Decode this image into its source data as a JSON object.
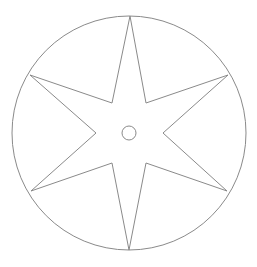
{
  "diagram": {
    "type": "six-pointed-star-in-circle",
    "stroke_color": "#8a8a8a",
    "outer_circle": {
      "cx": 129,
      "cy": 133,
      "r": 117
    },
    "inner_circle": {
      "cx": 129,
      "cy": 133,
      "r": 7
    },
    "star_points": [
      [
        130,
        16
      ],
      [
        146,
        103
      ],
      [
        228,
        75
      ],
      [
        163,
        133
      ],
      [
        227,
        191
      ],
      [
        146,
        163
      ],
      [
        129,
        250
      ],
      [
        112,
        163
      ],
      [
        31,
        191
      ],
      [
        96,
        133
      ],
      [
        30,
        75
      ],
      [
        112,
        103
      ]
    ]
  }
}
